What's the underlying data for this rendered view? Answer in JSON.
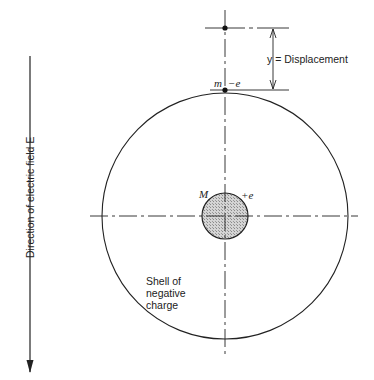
{
  "diagram": {
    "type": "atom-model",
    "labels": {
      "field_direction": "Direction of electric field E",
      "displacement": "y = Displacement",
      "electron_mass": "m",
      "electron_charge": "−e",
      "nucleus_mass": "M",
      "nucleus_charge": "+e",
      "shell": [
        "Shell of",
        "negative",
        "charge"
      ]
    },
    "colors": {
      "line": "#222222",
      "nucleus_fill": "#c8c8c8",
      "background": "#ffffff"
    },
    "geometry": {
      "center": [
        225,
        216
      ],
      "shell_radius": 123,
      "nucleus_radius": 23
    }
  }
}
